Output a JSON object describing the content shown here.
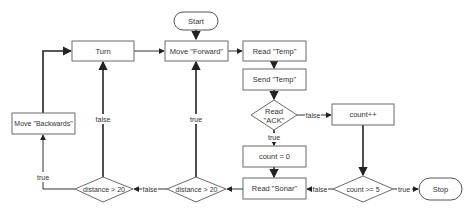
{
  "diagram": {
    "type": "flowchart",
    "nodes": {
      "start": {
        "label": "Start",
        "shape": "terminal"
      },
      "move_forward": {
        "label": "Move \"Forward\"",
        "shape": "process"
      },
      "read_temp": {
        "label": "Read \"Temp\"",
        "shape": "process"
      },
      "send_temp": {
        "label": "Send \"Temp\"",
        "shape": "process"
      },
      "read_ack": {
        "label_line1": "Read",
        "label_line2": "\"ACK\"",
        "shape": "decision"
      },
      "count_inc": {
        "label": "count++",
        "shape": "process"
      },
      "count_zero": {
        "label": "count = 0",
        "shape": "process"
      },
      "read_sonar": {
        "label": "Read \"Sonar\"",
        "shape": "process"
      },
      "count_check": {
        "label": "count >= 5",
        "shape": "decision"
      },
      "stop": {
        "label": "Stop",
        "shape": "terminal"
      },
      "distance_check_1": {
        "label": "distance > 20",
        "shape": "decision"
      },
      "distance_check_2": {
        "label": "distance > 20",
        "shape": "decision"
      },
      "turn": {
        "label": "Turn",
        "shape": "process"
      },
      "move_backwards": {
        "label": "Move \"Backwards\"",
        "shape": "process"
      }
    },
    "edges": {
      "ack_false": "false",
      "ack_true": "true",
      "count_false": "false",
      "count_true": "true",
      "dist2_false": "false",
      "dist2_true": "true",
      "dist1_false": "false",
      "dist1_true": "true"
    }
  }
}
